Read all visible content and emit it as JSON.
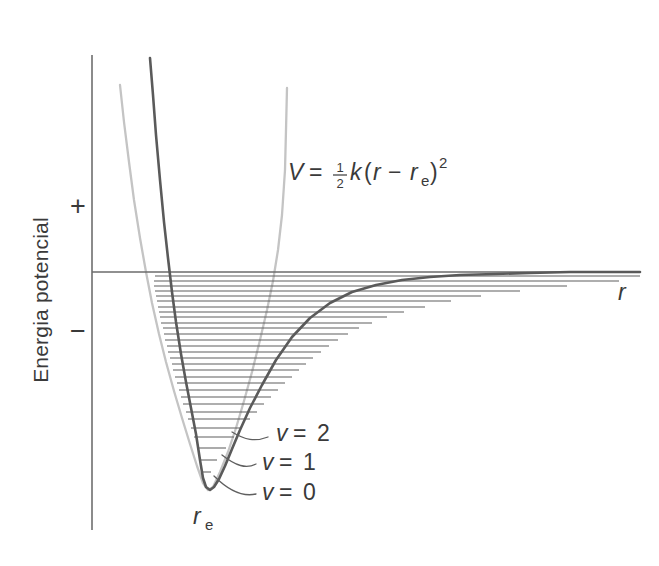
{
  "figure": {
    "kind": "morse-potential-diagram",
    "language": "pt",
    "background_color": "#ffffff"
  },
  "axes": {
    "y_axis_label": "Energia potencial",
    "positive_sign": "+",
    "negative_sign": "−",
    "x_axis_label": "r",
    "x_axis_label_italic": true,
    "zero_line_visible": true,
    "y_axis_x": 92,
    "y_axis_top": 55,
    "y_axis_bottom": 530,
    "zero_line_y": 272,
    "zero_line_x_start": 92,
    "zero_line_x_end": 640
  },
  "labels": {
    "equilibrium": {
      "base": "r",
      "subscript": "e",
      "x": 203,
      "y": 524
    },
    "formula": {
      "lhs": "V",
      "equals": "=",
      "fraction_numerator": "1",
      "fraction_denominator": "2",
      "constant": "k",
      "open_paren": "(",
      "var1": "r",
      "minus": "−",
      "var2": "r",
      "var2_subscript": "e",
      "close_paren": ")",
      "exponent": "2",
      "plain": "V = ½k(r − rₑ)²",
      "x": 288,
      "y": 178
    },
    "vibrational": [
      {
        "text": "v = 2",
        "var": "v",
        "eq": "=",
        "value": "2",
        "x": 276,
        "y": 441,
        "anchor_x": 232,
        "anchor_y": 432
      },
      {
        "text": "v = 1",
        "var": "v",
        "eq": "=",
        "value": "1",
        "x": 262,
        "y": 470,
        "anchor_x": 222,
        "anchor_y": 455
      },
      {
        "text": "v = 0",
        "var": "v",
        "eq": "=",
        "value": "0",
        "x": 262,
        "y": 500,
        "anchor_x": 214,
        "anchor_y": 476
      }
    ]
  },
  "chart_data": {
    "type": "line",
    "title": "",
    "xlabel": "r",
    "ylabel": "Energia potencial",
    "grid": false,
    "legend": "none",
    "series": [
      {
        "name": "Morse potential (anharmonic)",
        "color": "#5a5a5a",
        "style": "solid-thick",
        "description": "Anharmonic Morse curve: steep repulsive inner wall, minimum at r_e, asymptotic approach to dissociation limit at zero energy",
        "minimum_x": 203,
        "minimum_y": 490,
        "well_depth_px": 218,
        "points": [
          [
            150,
            58
          ],
          [
            153,
            95
          ],
          [
            156,
            135
          ],
          [
            160,
            180
          ],
          [
            164,
            222
          ],
          [
            168,
            258
          ],
          [
            172,
            292
          ],
          [
            176,
            322
          ],
          [
            181,
            354
          ],
          [
            186,
            382
          ],
          [
            191,
            408
          ],
          [
            196,
            434
          ],
          [
            200,
            460
          ],
          [
            203,
            478
          ],
          [
            206,
            487
          ],
          [
            210,
            490
          ],
          [
            214,
            487
          ],
          [
            219,
            479
          ],
          [
            225,
            466
          ],
          [
            232,
            449
          ],
          [
            240,
            430
          ],
          [
            250,
            408
          ],
          [
            262,
            385
          ],
          [
            276,
            360
          ],
          [
            292,
            337
          ],
          [
            310,
            318
          ],
          [
            330,
            303
          ],
          [
            352,
            292
          ],
          [
            376,
            285
          ],
          [
            402,
            280
          ],
          [
            430,
            277
          ],
          [
            460,
            275
          ],
          [
            495,
            274
          ],
          [
            530,
            273
          ],
          [
            570,
            272
          ],
          [
            610,
            272
          ],
          [
            640,
            272
          ]
        ]
      },
      {
        "name": "Harmonic approximation (parabola)",
        "color": "#c4c4c4",
        "style": "solid-light",
        "description": "Parabolic harmonic oscillator potential V = 1/2 k (r - r_e)^2, matching the Morse curve near the minimum",
        "minimum_x": 203,
        "minimum_y": 490,
        "points": [
          [
            120,
            85
          ],
          [
            124,
            122
          ],
          [
            129,
            162
          ],
          [
            134,
            200
          ],
          [
            140,
            238
          ],
          [
            146,
            272
          ],
          [
            152,
            303
          ],
          [
            159,
            334
          ],
          [
            166,
            362
          ],
          [
            174,
            391
          ],
          [
            182,
            418
          ],
          [
            190,
            444
          ],
          [
            197,
            466
          ],
          [
            203,
            483
          ],
          [
            208,
            490
          ],
          [
            213,
            487
          ],
          [
            220,
            472
          ],
          [
            228,
            452
          ],
          [
            236,
            428
          ],
          [
            244,
            401
          ],
          [
            252,
            372
          ],
          [
            260,
            340
          ],
          [
            267,
            310
          ],
          [
            273,
            281
          ],
          [
            278,
            250
          ],
          [
            282,
            215
          ],
          [
            285,
            170
          ],
          [
            286,
            130
          ],
          [
            287,
            88
          ]
        ]
      }
    ],
    "energy_levels": {
      "count": 30,
      "description": "Vibrational levels v = 0,1,2,...; spacing decreases with increasing v, converging at the dissociation limit",
      "lines": [
        [
          155,
          276,
          640,
          276
        ],
        [
          154,
          281,
          619,
          281
        ],
        [
          154,
          286,
          567,
          286
        ],
        [
          155,
          291,
          520,
          291
        ],
        [
          156,
          296,
          481,
          296
        ],
        [
          157,
          301,
          451,
          301
        ],
        [
          158,
          307,
          425,
          307
        ],
        [
          159,
          312,
          404,
          312
        ],
        [
          160,
          317,
          387,
          317
        ],
        [
          161,
          323,
          372,
          323
        ],
        [
          163,
          328,
          359,
          328
        ],
        [
          164,
          334,
          348,
          334
        ],
        [
          165,
          340,
          338,
          340
        ],
        [
          167,
          346,
          329,
          346
        ],
        [
          168,
          352,
          321,
          352
        ],
        [
          170,
          358,
          313,
          358
        ],
        [
          172,
          364,
          306,
          364
        ],
        [
          173,
          370,
          299,
          370
        ],
        [
          175,
          377,
          292,
          377
        ],
        [
          177,
          383,
          285,
          383
        ],
        [
          179,
          390,
          278,
          390
        ],
        [
          181,
          397,
          271,
          397
        ],
        [
          183,
          404,
          264,
          404
        ],
        [
          186,
          412,
          257,
          412
        ],
        [
          188,
          419,
          250,
          419
        ],
        [
          191,
          428,
          242,
          428
        ],
        [
          194,
          437,
          234,
          437
        ],
        [
          197,
          448,
          226,
          448
        ],
        [
          200,
          460,
          217,
          460
        ],
        [
          203,
          472,
          211,
          472
        ]
      ]
    }
  }
}
